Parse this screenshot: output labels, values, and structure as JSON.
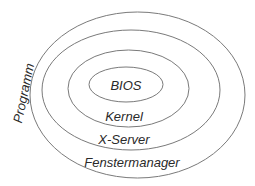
{
  "diagram": {
    "rings": [
      {
        "name": "programm-ring",
        "cx": 137.5,
        "cy": 95,
        "rx": 107.5,
        "ry": 83
      },
      {
        "name": "fenstermanager-ring",
        "cx": 131,
        "cy": 90,
        "rx": 89,
        "ry": 60
      },
      {
        "name": "x-server-ring",
        "cx": 128.5,
        "cy": 88.5,
        "rx": 60.5,
        "ry": 38.5
      },
      {
        "name": "bios-ring",
        "cx": 126,
        "cy": 84.5,
        "rx": 37,
        "ry": 17.5
      }
    ],
    "labels": {
      "bios": "BIOS",
      "kernel": "Kernel",
      "x_server": "X-Server",
      "fenstermanager": "Fenstermanager",
      "programm": "Programm"
    },
    "stroke_color": "#7a7a7a",
    "text_color": "#2a2a2a"
  }
}
